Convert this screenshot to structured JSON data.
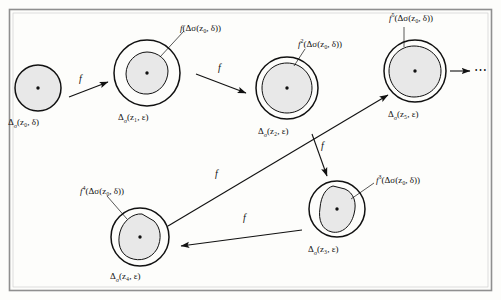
{
  "figure": {
    "title_visible": false,
    "background": "#fdfdfb",
    "frame_color": "#8f8f8f",
    "ink_color": "#111111",
    "disk_fill": "#e8e8e8",
    "ellipsis": "⋯"
  },
  "disks": [
    {
      "id": "z0",
      "center_label": "Δ",
      "label": "Δσ(z0, δ)",
      "label_base": "Δ",
      "label_sub": "σ",
      "label_args": "(z₀, δ)",
      "has_inner_blob": false,
      "cx": 38,
      "cy": 88,
      "r": 23
    },
    {
      "id": "z1",
      "label_base": "Δ",
      "label_sub": "σ",
      "label_args": "(z₁, ε)",
      "has_inner_blob": true,
      "cx": 147,
      "cy": 73,
      "r": 33
    },
    {
      "id": "z2",
      "label_base": "Δ",
      "label_sub": "σ",
      "label_args": "(z₂, ε)",
      "has_inner_blob": true,
      "cx": 287,
      "cy": 88,
      "r": 31
    },
    {
      "id": "z5",
      "label_base": "Δ",
      "label_sub": "σ",
      "label_args": "(z₅, ε)",
      "has_inner_blob": true,
      "cx": 415,
      "cy": 71,
      "r": 31
    },
    {
      "id": "z3",
      "label_base": "Δ",
      "label_sub": "σ",
      "label_args": "(z₃, ε)",
      "has_inner_blob": true,
      "cx": 337,
      "cy": 209,
      "r": 28
    },
    {
      "id": "z4",
      "label_base": "Δ",
      "label_sub": "σ",
      "label_args": "(z₄, ε)",
      "has_inner_blob": true,
      "cx": 140,
      "cy": 237,
      "r": 29
    }
  ],
  "image_labels": {
    "img1": {
      "f": "f",
      "exp": "",
      "args": "(Δσ(z₀, δ))"
    },
    "img2": {
      "f": "f",
      "exp": "2",
      "args": "(Δσ(z₀, δ))"
    },
    "img5": {
      "f": "f",
      "exp": "5",
      "args": "(Δσ(z₀, δ))"
    },
    "img3": {
      "f": "f",
      "exp": "3",
      "args": "(Δσ(z₀, δ))"
    },
    "img4": {
      "f": "f",
      "exp": "4",
      "args": "(Δσ(z₀, δ))"
    }
  },
  "arrows": [
    {
      "id": "a0",
      "label": "f",
      "from": "z0",
      "to": "z1"
    },
    {
      "id": "a1",
      "label": "f",
      "from": "z1",
      "to": "z2"
    },
    {
      "id": "a2",
      "label": "f",
      "from": "z2",
      "to": "z3"
    },
    {
      "id": "a3",
      "label": "f",
      "from": "z3",
      "to": "z4"
    },
    {
      "id": "a4",
      "label": "f",
      "from": "z4",
      "to": "z5"
    },
    {
      "id": "a5",
      "label": "",
      "from": "z5",
      "to": "ellipsis"
    }
  ],
  "parts": {
    "delta": "Δ",
    "sigma": "σ",
    "epsilon": "ε",
    "delta_small": "δ",
    "z0": "z₀",
    "z1": "z₁",
    "z2": "z₂",
    "z3": "z₃",
    "z4": "z₄",
    "z5": "z₅",
    "f": "f"
  }
}
